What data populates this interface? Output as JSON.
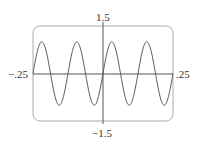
{
  "chart_data": {
    "type": "line",
    "title": "",
    "xlabel": "",
    "ylabel": "",
    "xlim": [
      -0.25,
      0.25
    ],
    "ylim": [
      -1.5,
      1.5
    ],
    "grid": false,
    "legend": null,
    "function": "y = sin(16πx)",
    "periods_shown": 4,
    "amplitude": 1,
    "tick_labels": {
      "x_min": "−.25",
      "x_max": ".25",
      "y_max": "1.5",
      "y_min": "−1.5"
    },
    "series": [
      {
        "name": "curve",
        "color": "#555555"
      }
    ]
  },
  "labels": {
    "y_max": "1.5",
    "y_min": "−1.5",
    "x_min": "−.25",
    "x_max": ".25"
  },
  "colors": {
    "frame": "#aaaaaa",
    "axis": "#555555",
    "curve": "#555555"
  }
}
